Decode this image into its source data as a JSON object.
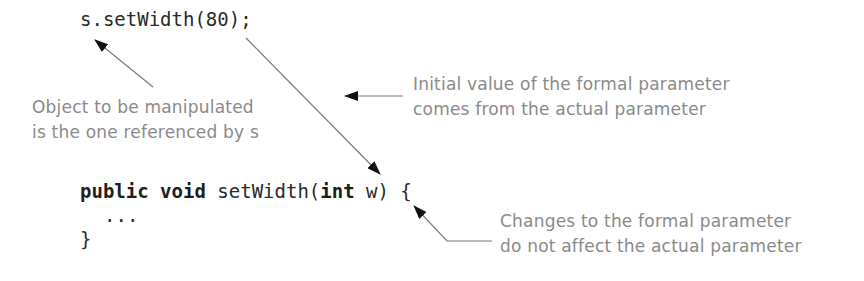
{
  "diagram": {
    "call_statement": "s.setWidth(80);",
    "method_header": {
      "kw_public": "public",
      "kw_void": "void",
      "name": "setWidth(",
      "kw_int": "int",
      "param": "w) {"
    },
    "method_body": "...",
    "method_close": "}",
    "annotations": {
      "object_note": {
        "line1": "Object to be manipulated",
        "line2": "is the one referenced by s"
      },
      "initial_value_note": {
        "line1": "Initial value of the formal parameter",
        "line2": "comes from the actual parameter"
      },
      "changes_note": {
        "line1": "Changes to the formal parameter",
        "line2": "do not affect the actual parameter"
      }
    },
    "colors": {
      "code": "#2a2a2a",
      "annotation": "#8a8a8a",
      "arrow": "#7a7a7a",
      "arrowhead": "#111111"
    }
  }
}
